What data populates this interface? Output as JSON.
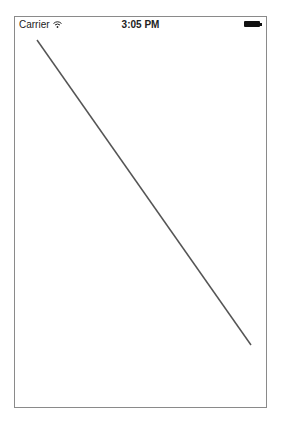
{
  "status_bar": {
    "carrier": "Carrier",
    "time": "3:05 PM",
    "wifi_icon": "wifi-icon",
    "battery_icon": "battery-icon"
  },
  "canvas": {
    "line": {
      "x1": 37,
      "y1": 40,
      "x2": 251,
      "y2": 345,
      "color": "#555555",
      "width": 1.5
    }
  }
}
